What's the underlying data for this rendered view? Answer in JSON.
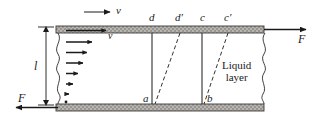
{
  "figure": {
    "background": "#ffffff",
    "ink": "#1a1a1a",
    "plate_fill": "#b5b2ad",
    "plate_edge": "#3a3a3a"
  },
  "labels": {
    "velocity_top": "v",
    "velocity_inner": "v",
    "gap": "l",
    "force_right": "F",
    "force_left": "F",
    "point_d": "d",
    "point_d_prime": "d′",
    "point_c": "c",
    "point_c_prime": "c′",
    "point_a": "a",
    "point_b": "b",
    "liquid_layer_line1": "Liquid",
    "liquid_layer_line2": "layer"
  },
  "geometry": {
    "plate_top_y": 26,
    "plate_bottom_y": 104,
    "plate_left_x": 56,
    "plate_right_x": 264,
    "plate_thickness": 7,
    "gap_label_x": 38,
    "line_d_x": 152,
    "line_c_x": 202,
    "dash_d_top_x": 180,
    "dash_c_top_x": 228
  },
  "velocity_profile": {
    "description": "Linear shear profile: arrow length proportional to distance from stationary bottom plate",
    "arrow_tail_x": 66,
    "arrows": [
      {
        "y": 31,
        "length": 42
      },
      {
        "y": 42,
        "length": 28
      },
      {
        "y": 52,
        "length": 22
      },
      {
        "y": 63,
        "length": 17
      },
      {
        "y": 73,
        "length": 12
      },
      {
        "y": 84,
        "length": 7
      },
      {
        "y": 95,
        "length": 3
      },
      {
        "y": 102,
        "length": 1
      }
    ]
  },
  "arrows": {
    "top_velocity": {
      "x1": 84,
      "y1": 12,
      "x2": 112,
      "y2": 12
    },
    "force_right": {
      "x1": 266,
      "y1": 29,
      "x2": 308,
      "y2": 29
    },
    "force_left": {
      "x1": 58,
      "y1": 108,
      "x2": 14,
      "y2": 108
    },
    "gap_dimension": {
      "x": 46,
      "y1": 28,
      "y2": 106
    }
  }
}
